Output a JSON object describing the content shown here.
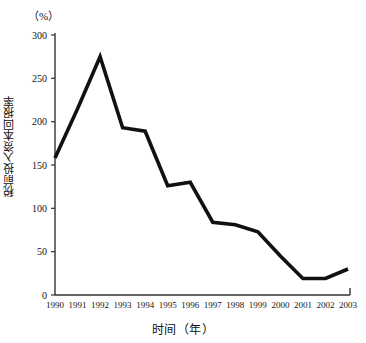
{
  "chart_data": {
    "type": "line",
    "title": "",
    "xlabel": "时间（年）",
    "ylabel": "税前投入资本回报率",
    "unit_label": "（%）",
    "categories": [
      "1990",
      "1991",
      "1992",
      "1993",
      "1994",
      "1995",
      "1996",
      "1997",
      "1998",
      "1999",
      "2000",
      "2001",
      "2002",
      "2003"
    ],
    "values": [
      158,
      215,
      275,
      193,
      189,
      126,
      130,
      84,
      81,
      73,
      45,
      19,
      19,
      30
    ],
    "series": [
      {
        "name": "税前投入资本回报率",
        "values": [
          158,
          215,
          275,
          193,
          189,
          126,
          130,
          84,
          81,
          73,
          45,
          19,
          19,
          30
        ]
      }
    ],
    "ylim": [
      0,
      300
    ],
    "y_ticks": [
      "0",
      "50",
      "100",
      "150",
      "200",
      "250",
      "300"
    ],
    "y_tick_values": [
      0,
      50,
      100,
      150,
      200,
      250,
      300
    ],
    "xlim": [
      "1990",
      "2003"
    ],
    "grid": false,
    "legend": "none",
    "line_color": "#111111",
    "axis_color": "#333333",
    "background_color": "#ffffff"
  }
}
